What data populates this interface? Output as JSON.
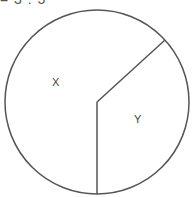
{
  "header": {
    "cropped_text": "= 3 : 5"
  },
  "diagram": {
    "type": "pie-division",
    "circle": {
      "cx": 97,
      "cy": 102,
      "r": 92,
      "stroke": "#555555"
    },
    "center": {
      "x": 97,
      "y": 102
    },
    "radii_endpoints": [
      {
        "x": 165,
        "y": 40
      },
      {
        "x": 97,
        "y": 194
      }
    ],
    "slices": [
      {
        "label": "X",
        "x": 56,
        "y": 82
      },
      {
        "label": "Y",
        "x": 138,
        "y": 119
      }
    ]
  }
}
